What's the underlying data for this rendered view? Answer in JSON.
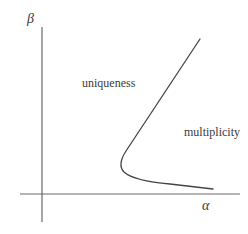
{
  "diagram": {
    "axes": {
      "x_label": "α",
      "y_label": "β"
    },
    "regions": {
      "left_label": "uniqueness",
      "right_label": "multiplicity"
    },
    "curve": {
      "description": "S-shaped boundary curve with a fold (nose) separating uniqueness and multiplicity regions",
      "color": "#444444"
    },
    "colors": {
      "axis": "#666666",
      "curve": "#444444",
      "background": "#ffffff"
    }
  }
}
